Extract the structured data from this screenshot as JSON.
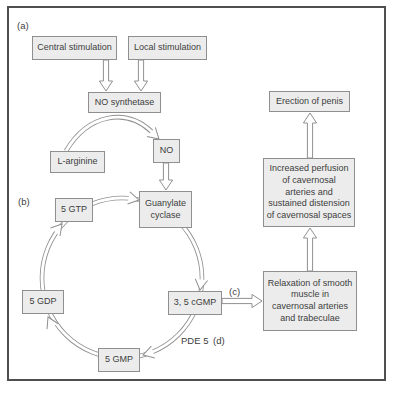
{
  "nodes": {
    "central_stimulation": "Central stimulation",
    "local_stimulation": "Local stimulation",
    "no_synthetase": "NO synthetase",
    "l_arginine": "L-arginine",
    "nitric_oxide": "NO",
    "guanylate_cyclase": [
      "Guanylate",
      "cyclase"
    ],
    "gtp": "5 GTP",
    "gdp": "5 GDP",
    "gmp": "5 GMP",
    "cgmp": "3, 5 cGMP",
    "relaxation": [
      "Relaxation of smooth",
      "muscle in",
      "cavernosal arteries",
      "and trabeculae"
    ],
    "increased_perfusion": [
      "Increased perfusion",
      "of cavernosal",
      "arteries and",
      "sustained distension",
      "of cavernosal spaces"
    ],
    "erection": "Erection of penis"
  },
  "labels": {
    "panel_a": "(a)",
    "panel_b": "(b)",
    "panel_c": "(c)",
    "panel_d": "(d)",
    "pde5": "PDE 5"
  },
  "colors": {
    "box_fill": "#ececec",
    "box_border": "#8f8f8f",
    "text": "#3d3d3d",
    "arrow_stroke": "#909090",
    "frame_border": "#4f4f4f",
    "background": "#ffffff"
  }
}
